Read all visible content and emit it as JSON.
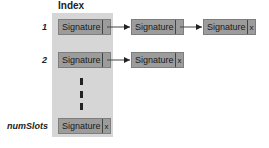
{
  "diagram": {
    "index_title": "Index",
    "rows": [
      {
        "index": "1",
        "nodes": [
          {
            "label": "Signature",
            "pointer": ""
          },
          {
            "label": "Signature",
            "pointer": ""
          },
          {
            "label": "Signature",
            "pointer": "x"
          }
        ]
      },
      {
        "index": "2",
        "nodes": [
          {
            "label": "Signature",
            "pointer": ""
          },
          {
            "label": "Signature",
            "pointer": "x"
          }
        ]
      },
      {
        "index": "numSlots",
        "nodes": [
          {
            "label": "Signature",
            "pointer": "x"
          }
        ]
      }
    ],
    "colors": {
      "panel": "#d6d6d6",
      "node": "#9c9c9c",
      "arrow": "#222222"
    }
  }
}
